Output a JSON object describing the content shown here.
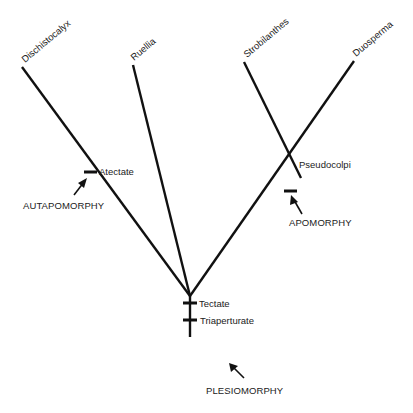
{
  "diagram": {
    "type": "cladogram",
    "taxa": [
      {
        "label": "Dischistocalyx"
      },
      {
        "label": "Ruellia"
      },
      {
        "label": "Strobilanthes"
      },
      {
        "label": "Duosperma"
      }
    ],
    "characters": [
      {
        "label": "Atectate"
      },
      {
        "label": "Pseudocolpi"
      },
      {
        "label": "Tectate"
      },
      {
        "label": "Triaperturate"
      }
    ],
    "annotations": [
      {
        "label": "AUTAPOMORPHY"
      },
      {
        "label": "APOMORPHY"
      },
      {
        "label": "PLESIOMORPHY"
      }
    ],
    "colors": {
      "line": "#111111",
      "text": "#222222",
      "background": "#ffffff"
    }
  }
}
